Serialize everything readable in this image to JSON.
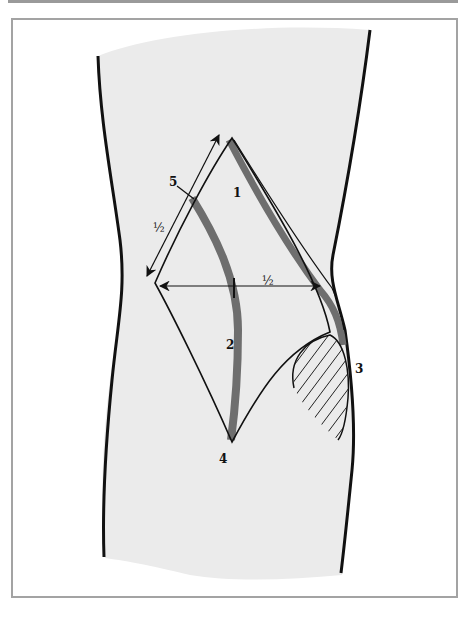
{
  "figure": {
    "type": "anatomical-incision-diagram"
  },
  "labels": {
    "one": "1",
    "two": "2",
    "three": "3",
    "four": "4",
    "five": "5",
    "half_diagonal": "½",
    "half_horizontal": "½"
  },
  "colors": {
    "limb_fill": "#ebebeb",
    "outline": "#111111",
    "band": "#6e6e6e",
    "frame_border": "#a3a3a3",
    "hatch": "#222222"
  }
}
